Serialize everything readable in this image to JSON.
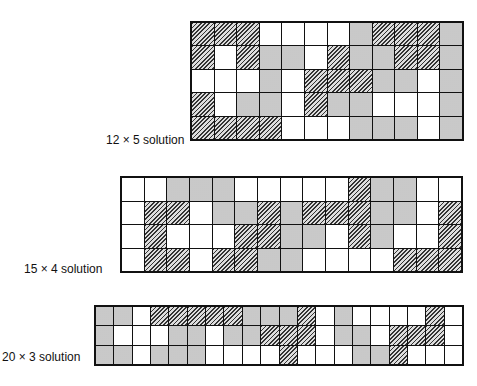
{
  "legend": {
    "H": "hatched piece",
    "D": "dotted piece",
    "W": "white piece"
  },
  "puzzles": [
    {
      "label": "12 × 5 solution",
      "cols": 12,
      "rows": 5,
      "cells": [
        "HHHWWWWDHHHD",
        "HWHDDWHDDHHD",
        "WWWDWHHHDDWD",
        "HWDDWHDDWWWD",
        "HHHHWWWDDDWD"
      ]
    },
    {
      "label": "15 × 4 solution",
      "cols": 15,
      "rows": 4,
      "cells": [
        "WWDDDWWWWWHDDWW",
        "WHHWDDHDHHHDDWH",
        "WHWWWHHDDWHDWWH",
        "WHHWHHDDWWWWHHH"
      ]
    },
    {
      "label": "20 × 3 solution",
      "cols": 20,
      "rows": 3,
      "cells": [
        "DDWHHHHHDDDHWDWWWWHW",
        "DWWWDDWDDHHHWDDWHHHW",
        "DDWDDDWWWWHWWWDDHWWW"
      ]
    }
  ]
}
